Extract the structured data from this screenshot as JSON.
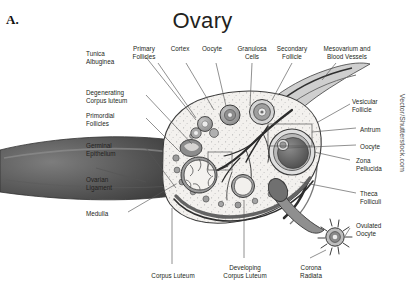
{
  "figure": {
    "marker": "A.",
    "title": "Ovary",
    "watermark": "Vector/Shutterstock.com"
  },
  "palette": {
    "ink": "#231f20",
    "outline": "#3d3d3d",
    "cortex_fill": "#f2f0ed",
    "tunica": "#6f6f6f",
    "ligament_dark": "#4a4a4a",
    "medulla_vessel": "#2e2e2e",
    "follicle_mid": "#9a9a9a",
    "antrum_dark": "#5a5a5a",
    "leader": "#555555",
    "background": "#ffffff"
  },
  "labels": {
    "top": [
      {
        "id": "primary-follicles",
        "text": "Primary\nFollicles",
        "x": 144,
        "y": 45,
        "align": "c",
        "w": 34
      },
      {
        "id": "cortex",
        "text": "Cortex",
        "x": 180,
        "y": 45,
        "align": "c",
        "w": 26
      },
      {
        "id": "oocyte-top",
        "text": "Oocyte",
        "x": 212,
        "y": 45,
        "align": "c",
        "w": 28
      },
      {
        "id": "granulosa-cells",
        "text": "Granulosa\nCells",
        "x": 243,
        "y": 45,
        "align": "c",
        "w": 38
      },
      {
        "id": "secondary-follicle",
        "text": "Secondary\nFollicle",
        "x": 283,
        "y": 45,
        "align": "c",
        "w": 40
      },
      {
        "id": "mesovarium",
        "text": "Mesovarium and\nBlood Vessels",
        "x": 325,
        "y": 45,
        "align": "c",
        "w": 58
      }
    ],
    "left": [
      {
        "id": "tunica-albuginea",
        "text": "Tunica\nAlbuginea",
        "x": 86,
        "y": 50,
        "align": "l",
        "w": 58
      },
      {
        "id": "degenerating-cl",
        "text": "Degenerating\nCorpus luteum",
        "x": 86,
        "y": 89,
        "align": "l",
        "w": 58
      },
      {
        "id": "primordial-follicles",
        "text": "Primordial\nFollicles",
        "x": 86,
        "y": 112,
        "align": "l",
        "w": 58
      },
      {
        "id": "germinal-epithelium",
        "text": "Germinal\nEpithelium",
        "x": 86,
        "y": 142,
        "align": "l",
        "w": 58
      },
      {
        "id": "ovarian-ligament",
        "text": "Ovarian\nLigament",
        "x": 86,
        "y": 176,
        "align": "l",
        "w": 58
      },
      {
        "id": "medulla",
        "text": "Medulla",
        "x": 86,
        "y": 210,
        "align": "l",
        "w": 58
      }
    ],
    "right": [
      {
        "id": "vesicular-follicle",
        "text": "Vesicular\nFollicle",
        "x": 352,
        "y": 98,
        "align": "l",
        "w": 52
      },
      {
        "id": "antrum",
        "text": "Antrum",
        "x": 358,
        "y": 126,
        "align": "l",
        "w": 46
      },
      {
        "id": "oocyte-right",
        "text": "Oocyte",
        "x": 358,
        "y": 143,
        "align": "l",
        "w": 46
      },
      {
        "id": "zona-pellucida",
        "text": "Zona\nPellucida",
        "x": 352,
        "y": 157,
        "align": "l",
        "w": 52
      },
      {
        "id": "theca-folliculi",
        "text": "Theca\nFolliculi",
        "x": 358,
        "y": 190,
        "align": "l",
        "w": 46
      },
      {
        "id": "ovulated-oocyte",
        "text": "Ovulated\nOocyte",
        "x": 352,
        "y": 222,
        "align": "l",
        "w": 52
      }
    ],
    "bottom": [
      {
        "id": "corpus-luteum",
        "text": "Corpus Luteum",
        "x": 133,
        "y": 272,
        "align": "c",
        "w": 60
      },
      {
        "id": "developing-cl",
        "text": "Developing\nCorpus Luteum",
        "x": 215,
        "y": 266,
        "align": "c",
        "w": 62
      },
      {
        "id": "corona-radiata",
        "text": "Corona\nRadiata",
        "x": 288,
        "y": 266,
        "align": "c",
        "w": 44
      }
    ]
  },
  "structures": [
    {
      "id": "ovary-body",
      "name": "ovary-cross-section"
    },
    {
      "id": "ovarian-ligament",
      "name": "ovarian-ligament-stalk"
    },
    {
      "id": "mesovarium-band",
      "name": "mesovarium-blood-vessels"
    },
    {
      "id": "medulla-vessels",
      "name": "medulla-vascular-tree"
    },
    {
      "id": "corpus-luteum",
      "name": "corpus-luteum-body"
    },
    {
      "id": "developing-cl",
      "name": "developing-corpus-luteum"
    },
    {
      "id": "vesicular-follicle",
      "name": "vesicular-graafian-follicle"
    },
    {
      "id": "ovulated-oocyte",
      "name": "ovulated-oocyte-corona-radiata"
    }
  ]
}
